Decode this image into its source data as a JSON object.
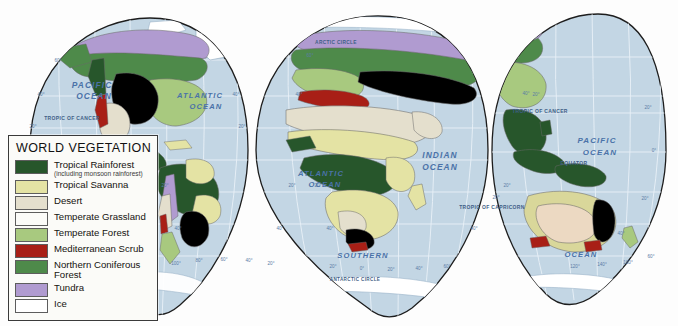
{
  "map": {
    "title": "World Vegetation",
    "projection": "Goode's interrupted homolosine",
    "ocean_color": "#c3d6e4",
    "graticule_color": "#e8f0f6",
    "outline_color": "#1d1d1d",
    "ice_color": "#ffffff"
  },
  "legend": {
    "title": "WORLD  VEGETATION",
    "items": [
      {
        "label": "Tropical Rainforest",
        "sublabel": "(including monsoon rainforest)",
        "color": "#27562b"
      },
      {
        "label": "Tropical Savanna",
        "sublabel": "",
        "color": "#e4e3a4"
      },
      {
        "label": "Desert",
        "sublabel": "",
        "color": "#e4dfcd"
      },
      {
        "label": "Temperate Grassland",
        "sublabel": "",
        "color": "#f3a martyr",
        "color_hex": "#f3a martyr"
      },
      {
        "label": "Temperate Forest",
        "sublabel": "",
        "color": "#a8c97f"
      },
      {
        "label": "Mediterranean Scrub",
        "sublabel": "",
        "color": "#a81f16"
      },
      {
        "label": "Northern Coniferous Forest",
        "sublabel": "",
        "color": "#4e8a4a"
      },
      {
        "label": "Tundra",
        "sublabel": "",
        "color": "#b09bd0"
      },
      {
        "label": "Ice",
        "sublabel": "",
        "color": "#ffffff"
      }
    ]
  },
  "ocean_labels": [
    {
      "text": "PACIFIC",
      "x": 92,
      "y": 88,
      "size": 8.4
    },
    {
      "text": "OCEAN",
      "x": 94,
      "y": 99,
      "size": 8.4
    },
    {
      "text": "ATLANTIC",
      "x": 200,
      "y": 98,
      "size": 7.6
    },
    {
      "text": "OCEAN",
      "x": 206,
      "y": 109,
      "size": 7.6
    },
    {
      "text": "ATLANTIC",
      "x": 321,
      "y": 176,
      "size": 7.6
    },
    {
      "text": "OCEAN",
      "x": 325,
      "y": 187,
      "size": 7.6
    },
    {
      "text": "INDIAN",
      "x": 440,
      "y": 158,
      "size": 8.4
    },
    {
      "text": "OCEAN",
      "x": 440,
      "y": 170,
      "size": 8.4
    },
    {
      "text": "SOUTHERN",
      "x": 363,
      "y": 258,
      "size": 7.6
    },
    {
      "text": "PACIFIC",
      "x": 597,
      "y": 143,
      "size": 8.0
    },
    {
      "text": "OCEAN",
      "x": 600,
      "y": 155,
      "size": 8.0
    },
    {
      "text": "OCEAN",
      "x": 581,
      "y": 257,
      "size": 7.6
    }
  ],
  "line_labels": [
    {
      "text": "TROPIC OF CANCER",
      "x": 72,
      "y": 120,
      "size": 5.0
    },
    {
      "text": "ARCTIC CIRCLE",
      "x": 336,
      "y": 44,
      "size": 4.8
    },
    {
      "text": "ANTARCTIC CIRCLE",
      "x": 355,
      "y": 281,
      "size": 4.6
    },
    {
      "text": "TROPIC OF CANCER",
      "x": 540,
      "y": 113,
      "size": 5.0
    },
    {
      "text": "EQUATOR",
      "x": 574,
      "y": 165,
      "size": 5.0
    },
    {
      "text": "TROPIC OF CAPRICORN",
      "x": 492,
      "y": 209,
      "size": 5.0
    }
  ],
  "tick_labels": [
    {
      "text": "60°",
      "x": 58,
      "y": 62
    },
    {
      "text": "40°",
      "x": 41,
      "y": 96
    },
    {
      "text": "20°",
      "x": 33,
      "y": 128
    },
    {
      "text": "40°",
      "x": 236,
      "y": 96
    },
    {
      "text": "20°",
      "x": 242,
      "y": 128
    },
    {
      "text": "20°",
      "x": 165,
      "y": 187
    },
    {
      "text": "20°",
      "x": 292,
      "y": 187
    },
    {
      "text": "40°",
      "x": 178,
      "y": 230
    },
    {
      "text": "40°",
      "x": 280,
      "y": 230
    },
    {
      "text": "100°",
      "x": 176,
      "y": 265
    },
    {
      "text": "80°",
      "x": 199,
      "y": 262
    },
    {
      "text": "60°",
      "x": 224,
      "y": 261
    },
    {
      "text": "40°",
      "x": 249,
      "y": 262
    },
    {
      "text": "20°",
      "x": 271,
      "y": 265
    },
    {
      "text": "60°",
      "x": 310,
      "y": 57
    },
    {
      "text": "40°",
      "x": 299,
      "y": 96
    },
    {
      "text": "20°",
      "x": 318,
      "y": 187
    },
    {
      "text": "20°",
      "x": 507,
      "y": 187
    },
    {
      "text": "40°",
      "x": 330,
      "y": 230
    },
    {
      "text": "40°",
      "x": 474,
      "y": 230
    },
    {
      "text": "20°",
      "x": 333,
      "y": 268
    },
    {
      "text": "0°",
      "x": 362,
      "y": 270
    },
    {
      "text": "20°",
      "x": 391,
      "y": 271
    },
    {
      "text": "40°",
      "x": 419,
      "y": 270
    },
    {
      "text": "60°",
      "x": 447,
      "y": 268
    },
    {
      "text": "20°",
      "x": 536,
      "y": 96
    },
    {
      "text": "20°",
      "x": 648,
      "y": 109
    },
    {
      "text": "0°",
      "x": 654,
      "y": 152
    },
    {
      "text": "20°",
      "x": 645,
      "y": 200
    },
    {
      "text": "40°",
      "x": 621,
      "y": 235
    },
    {
      "text": "120°",
      "x": 575,
      "y": 268
    },
    {
      "text": "140°",
      "x": 602,
      "y": 266
    },
    {
      "text": "160°",
      "x": 628,
      "y": 264
    },
    {
      "text": "60°",
      "x": 651,
      "y": 258
    },
    {
      "text": "20°",
      "x": 496,
      "y": 199
    },
    {
      "text": "40°",
      "x": 526,
      "y": 95
    }
  ],
  "chart_data": {
    "type": "map",
    "title": "World Vegetation",
    "categories": [
      "Tropical Rainforest",
      "Tropical Savanna",
      "Desert",
      "Temperate Grassland",
      "Temperate Forest",
      "Mediterranean Scrub",
      "Northern Coniferous Forest",
      "Tundra",
      "Ice"
    ],
    "colors": [
      "#27562b",
      "#e4e3a4",
      "#e4dfcd",
      "#f3a martyr",
      "#a8c97f",
      "#a81f16",
      "#4e8a4a",
      "#b09bd0",
      "#ffffff"
    ]
  }
}
